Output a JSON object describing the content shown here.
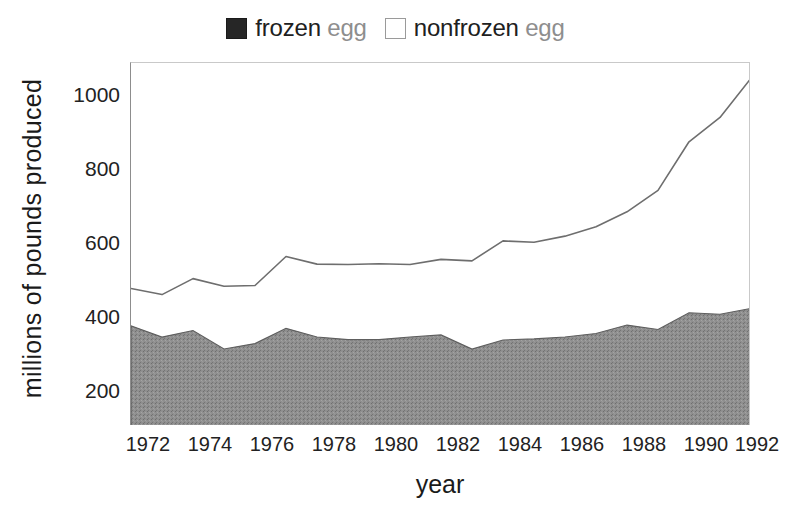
{
  "chart_data": {
    "type": "area",
    "title": "",
    "subtitle": "",
    "xlabel": "year",
    "ylabel": "millions of pounds produced",
    "xlim": [
      1972,
      1992
    ],
    "ylim": [
      100,
      1100
    ],
    "grid": false,
    "stacked": true,
    "legend_position": "top-center",
    "x": [
      1972,
      1973,
      1974,
      1975,
      1976,
      1977,
      1978,
      1979,
      1980,
      1981,
      1982,
      1983,
      1984,
      1985,
      1986,
      1987,
      1988,
      1989,
      1990,
      1991,
      1992
    ],
    "xticks": [
      1972,
      1974,
      1976,
      1978,
      1980,
      1982,
      1984,
      1986,
      1988,
      1990,
      1992
    ],
    "xtick_labels": [
      "1972",
      "1974",
      "1976",
      "1978",
      "1980",
      "1982",
      "1984",
      "1986",
      "1988",
      "1990",
      "1992"
    ],
    "yticks": [
      200,
      400,
      600,
      800,
      1000
    ],
    "ytick_labels": [
      "200",
      "400",
      "600",
      "800",
      "1000"
    ],
    "series": [
      {
        "name": "frozen egg",
        "color": "#8f8f8f",
        "edge_color": "#5a5a5a",
        "values": [
          376,
          345,
          363,
          312,
          327,
          369,
          345,
          338,
          338,
          345,
          351,
          312,
          337,
          340,
          345,
          355,
          378,
          366,
          412,
          408,
          424
        ]
      },
      {
        "name": "nonfrozen egg",
        "color": "#ffffff",
        "edge_color": "#6e6e6e",
        "values": [
          103,
          117,
          143,
          173,
          160,
          198,
          201,
          207,
          209,
          200,
          208,
          243,
          273,
          266,
          278,
          294,
          312,
          383,
          471,
          542,
          634
        ]
      }
    ],
    "cumulative_totals": [
      479,
      462,
      506,
      485,
      487,
      567,
      546,
      545,
      547,
      545,
      559,
      555,
      610,
      606,
      623,
      649,
      690,
      749,
      883,
      950,
      1058
    ]
  },
  "legend": {
    "entries": [
      {
        "keyword": "frozen",
        "suffix": "egg",
        "swatch": "filled-square-icon",
        "style": "filled"
      },
      {
        "keyword": "nonfrozen",
        "suffix": "egg",
        "swatch": "hollow-square-icon",
        "style": "hollow"
      }
    ]
  },
  "colors": {
    "frozen_fill": "#8f8f8f",
    "nonfrozen_fill": "#ffffff",
    "line": "#6e6e6e",
    "axis": "#8d8d8d",
    "text": "#1a1a1a",
    "muted_text": "#8e8e8e"
  }
}
